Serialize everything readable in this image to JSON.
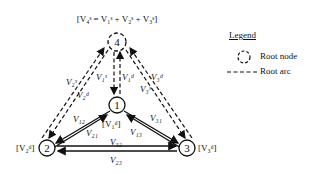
{
  "diagram": {
    "top_equation": "[V₄ˢ = V₁ˢ + V₂ˢ + V₃ˢ]",
    "nodes": [
      {
        "id": "1",
        "label": "1",
        "annotation": "[V₁ᵈ]"
      },
      {
        "id": "2",
        "label": "2",
        "annotation": "[V₂ᵈ]"
      },
      {
        "id": "3",
        "label": "3",
        "annotation": "[V₃ᵈ]"
      },
      {
        "id": "4",
        "label": "4",
        "annotation": "[V₄ˢ = V₁ˢ + V₂ˢ + V₃ˢ]",
        "root": true
      }
    ],
    "root_arc_labels": {
      "v1s": "V₁ˢ",
      "v1d": "V₁ᵈ",
      "v2s": "V₂ˢ",
      "v2d": "V₂ᵈ",
      "v3s": "V₃ˢ",
      "v3d": "V₃ᵈ"
    },
    "arc_labels": {
      "v12": "V₁₂",
      "v21": "V₂₁",
      "v13": "V₁₃",
      "v31": "V₃₁",
      "v23": "V₂₃",
      "v32": "V₃₂"
    },
    "annotations": {
      "node1": "[V₁ᵈ]",
      "node2": "[V₂ᵈ]",
      "node3": "[V₃ᵈ]"
    }
  },
  "legend": {
    "title": "Legend",
    "items": [
      {
        "symbol": "dashed-circle",
        "label": "Root node"
      },
      {
        "symbol": "dashed-line",
        "label": "Root arc"
      }
    ]
  }
}
